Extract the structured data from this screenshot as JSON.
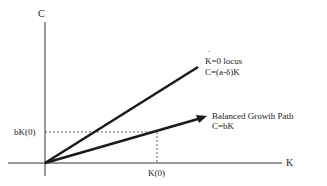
{
  "diagram": {
    "axes": {
      "y_label": "C",
      "x_label": "K"
    },
    "lines": [
      {
        "id": "kdot-zero-locus",
        "label_line1": "K=0 locus",
        "label_dot": "˙",
        "label_line2": "C=(a-δ)K"
      },
      {
        "id": "balanced-growth-path",
        "label_line1": "Balanced Growth Path",
        "label_line2": "C=bK"
      }
    ],
    "markers": {
      "y_tick": "bK(0)",
      "x_tick": "K(0)"
    },
    "colors": {
      "line": "#1a1a1a",
      "axis": "#333333",
      "dashed": "#333333"
    }
  }
}
